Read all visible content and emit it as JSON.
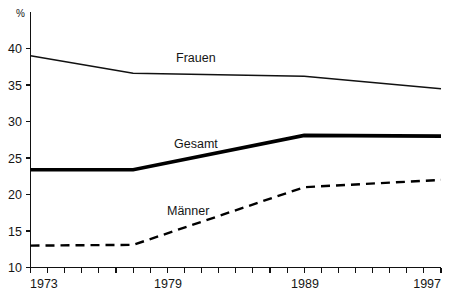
{
  "chart_data": {
    "type": "line",
    "title": "",
    "subtitle": "",
    "xlabel": "",
    "ylabel": "%",
    "unit_label": "%",
    "xlim": [
      1973,
      1997
    ],
    "ylim": [
      10,
      40
    ],
    "grid": false,
    "legend_position": "inline-labels",
    "x_tick_labels": [
      "1973",
      "1979",
      "1989",
      "1997"
    ],
    "x_tick_values": [
      1973,
      1979,
      1989,
      1997
    ],
    "x_minor_tick_step": 1,
    "y_tick_labels": [
      "10",
      "15",
      "20",
      "25",
      "30",
      "35",
      "40"
    ],
    "y_tick_values": [
      10,
      15,
      20,
      25,
      30,
      35,
      40
    ],
    "x": [
      1973,
      1979,
      1989,
      1997
    ],
    "series": [
      {
        "name": "Frauen",
        "style": "solid-thin",
        "label": "Frauen",
        "values": [
          39.0,
          36.6,
          36.2,
          34.5
        ]
      },
      {
        "name": "Gesamt",
        "style": "solid-thick",
        "label": "Gesamt",
        "values": [
          23.4,
          23.4,
          28.1,
          28.0
        ]
      },
      {
        "name": "Männer",
        "style": "dashed",
        "label": "Männer",
        "values": [
          13.0,
          13.1,
          21.0,
          22.0
        ]
      }
    ],
    "annotations": [
      {
        "text": "Frauen",
        "x": 1982.0,
        "y": 38.2
      },
      {
        "text": "Gesamt",
        "x": 1981.8,
        "y": 26.4
      },
      {
        "text": "Männer",
        "x": 1981.3,
        "y": 17.6
      }
    ]
  }
}
